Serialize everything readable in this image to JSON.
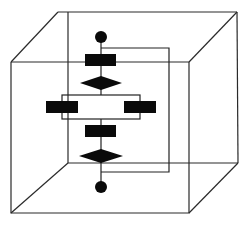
{
  "diagram": {
    "title": "",
    "canvas": {
      "width": 247,
      "height": 226,
      "background": "#ffffff"
    },
    "colors": {
      "stroke": "#2a2a2a",
      "fill": "#0a0a0a"
    },
    "cube": {
      "front": {
        "tl": [
          11,
          62
        ],
        "tr": [
          189,
          62
        ],
        "br": [
          189,
          213
        ],
        "bl": [
          11,
          213
        ]
      },
      "back": {
        "tl": [
          58,
          12
        ],
        "tr": [
          237,
          12
        ],
        "br": [
          238,
          163
        ],
        "bl": [
          68,
          163
        ]
      },
      "back_left_vertical_x": 68
    },
    "flowchart": {
      "start_node": {
        "shape": "circle",
        "cx": 101,
        "cy": 37,
        "r": 6
      },
      "process_1": {
        "shape": "rect",
        "x": 85,
        "y": 54,
        "w": 31,
        "h": 12
      },
      "decision_1": {
        "shape": "diamond",
        "cx": 101,
        "cy": 83,
        "halfw": 21,
        "halfh": 7
      },
      "parallel_box": {
        "shape": "rect-outline",
        "x": 62,
        "y": 95,
        "w": 78,
        "h": 24
      },
      "process_left": {
        "shape": "rect",
        "x": 46,
        "y": 101,
        "w": 32,
        "h": 12
      },
      "process_right": {
        "shape": "rect",
        "x": 124,
        "y": 101,
        "w": 32,
        "h": 12
      },
      "process_2": {
        "shape": "rect",
        "x": 85,
        "y": 125,
        "w": 31,
        "h": 12
      },
      "decision_2": {
        "shape": "diamond",
        "cx": 101,
        "cy": 156,
        "halfw": 22,
        "halfh": 7
      },
      "end_node": {
        "shape": "circle",
        "cx": 101,
        "cy": 187,
        "r": 6
      },
      "spine_x": 101,
      "loop": {
        "top_y": 48,
        "bottom_y": 172,
        "right_x": 169
      }
    }
  }
}
